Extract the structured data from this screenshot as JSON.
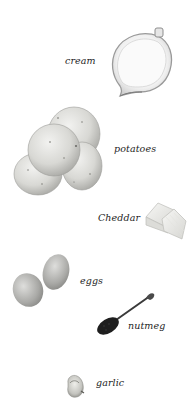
{
  "page": {
    "background": "#ffffff"
  },
  "ingredients": [
    {
      "name": "cream",
      "label": "cream",
      "icon": "cream-jug-icon"
    },
    {
      "name": "potatoes",
      "label": "potatoes",
      "icon": "potatoes-icon"
    },
    {
      "name": "cheddar",
      "label": "Cheddar",
      "icon": "cheese-block-icon"
    },
    {
      "name": "eggs",
      "label": "eggs",
      "icon": "eggs-icon"
    },
    {
      "name": "nutmeg",
      "label": "nutmeg",
      "icon": "spoon-nutmeg-icon"
    },
    {
      "name": "garlic",
      "label": "garlic",
      "icon": "garlic-clove-icon"
    }
  ]
}
